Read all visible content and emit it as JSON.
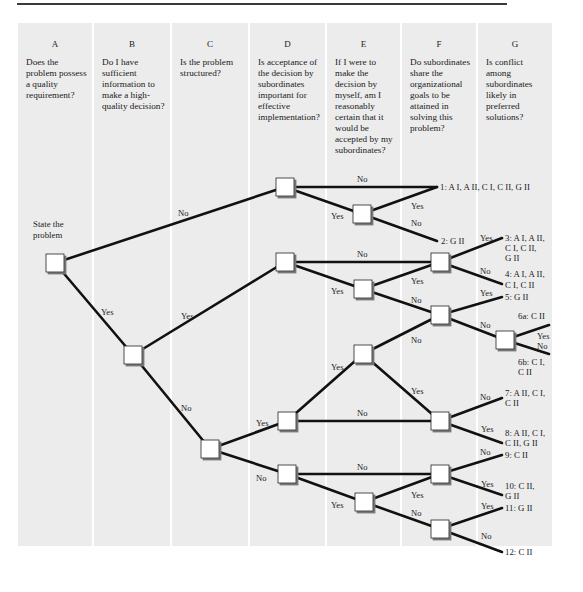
{
  "columns": [
    {
      "letter": "A",
      "question": "Does the problem possess a quality requirement?"
    },
    {
      "letter": "B",
      "question": "Do I have sufficient information to make a high-quality decision?"
    },
    {
      "letter": "C",
      "question": "Is the problem structured?"
    },
    {
      "letter": "D",
      "question": "Is acceptance of the decision by subordinates important for effective implementation?"
    },
    {
      "letter": "E",
      "question": "If I were to make the decision by myself, am I reasonably certain that it would be accepted by my subordinates?"
    },
    {
      "letter": "F",
      "question": "Do subordinates share the organizational goals to be attained in solving this problem?"
    },
    {
      "letter": "G",
      "question": "Is conflict among subordinates likely in preferred solutions?"
    }
  ],
  "start_label": "State the problem",
  "branch_labels": {
    "yes": "Yes",
    "no": "No"
  },
  "outcomes": [
    {
      "id": "1",
      "text": "1: A I, A II, C I, C II, G II"
    },
    {
      "id": "2",
      "text": "2: G II"
    },
    {
      "id": "3a",
      "text": "3: A I, A II,"
    },
    {
      "id": "3b",
      "text": "C I, C II,"
    },
    {
      "id": "3c",
      "text": "G II"
    },
    {
      "id": "4a",
      "text": "4: A I, A II,"
    },
    {
      "id": "4b",
      "text": "C I, C II"
    },
    {
      "id": "5",
      "text": "5: G II"
    },
    {
      "id": "6a",
      "text": "6a: C II"
    },
    {
      "id": "6b1",
      "text": "6b: C I,"
    },
    {
      "id": "6b2",
      "text": "C II"
    },
    {
      "id": "7a",
      "text": "7: A II, C I,"
    },
    {
      "id": "7b",
      "text": "C II"
    },
    {
      "id": "8a",
      "text": "8: A II, C I,"
    },
    {
      "id": "8b",
      "text": "C II, G II"
    },
    {
      "id": "9",
      "text": "9: C II"
    },
    {
      "id": "10a",
      "text": "10: C II,"
    },
    {
      "id": "10b",
      "text": "G II"
    },
    {
      "id": "11",
      "text": "11: G II"
    },
    {
      "id": "12",
      "text": "12: C II"
    }
  ],
  "colors": {
    "column_bg": "#ececec",
    "line": "#111111",
    "node_fill": "#ffffff"
  }
}
